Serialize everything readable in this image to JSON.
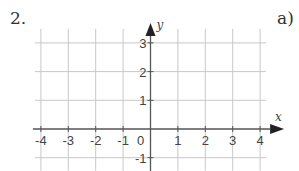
{
  "problem": {
    "number": "2.",
    "part": "a)"
  },
  "chart_data": {
    "type": "coordinate-grid",
    "title": "",
    "xlabel": "x",
    "ylabel": "y",
    "xlim": [
      -4,
      4
    ],
    "ylim": [
      -1,
      3
    ],
    "x_ticks": [
      "-4",
      "-3",
      "-2",
      "-1",
      "1",
      "2",
      "3",
      "4"
    ],
    "y_ticks": [
      "3",
      "2",
      "1",
      "-1"
    ],
    "origin_label": "0",
    "grid": true,
    "series": []
  },
  "colors": {
    "grid": "#c8c8c8",
    "axis": "#555555",
    "text": "#444444"
  }
}
